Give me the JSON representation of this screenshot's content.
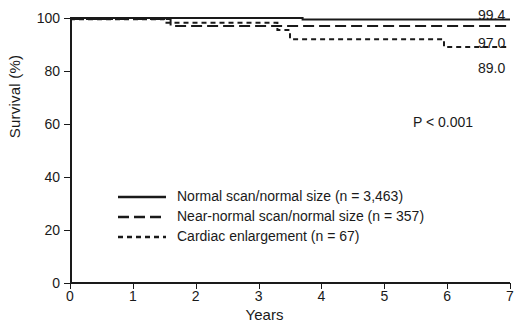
{
  "chart_data": {
    "type": "line",
    "title": "",
    "xlabel": "Years",
    "ylabel": "Survival (%)",
    "xlim": [
      0,
      7
    ],
    "ylim": [
      0,
      100
    ],
    "xticks": [
      "0",
      "1",
      "2",
      "3",
      "4",
      "5",
      "6",
      "7"
    ],
    "yticks": [
      "0",
      "20",
      "40",
      "60",
      "80",
      "100"
    ],
    "grid": false,
    "legend_position": "lower-left-inside",
    "annotation": "P < 0.001",
    "series": [
      {
        "name": "Normal scan/normal size (n = 3,463)",
        "style": "solid",
        "n": "3,463",
        "endpoint_label": "99.4",
        "x": [
          0,
          3.7,
          3.7,
          7
        ],
        "y": [
          100,
          100,
          99.4,
          99.4
        ]
      },
      {
        "name": "Near-normal scan/normal size (n = 357)",
        "style": "long-dash",
        "n": "357",
        "endpoint_label": "97.0",
        "x": [
          0,
          1.6,
          1.6,
          7
        ],
        "y": [
          99.6,
          99.6,
          97.0,
          97.0
        ]
      },
      {
        "name": "Cardiac enlargement (n = 67)",
        "style": "short-dash",
        "n": "67",
        "endpoint_label": "89.0",
        "x": [
          0,
          1.5,
          1.5,
          3.3,
          3.3,
          3.5,
          3.5,
          5.95,
          5.95,
          7
        ],
        "y": [
          99.5,
          99.5,
          98.2,
          98.2,
          95.5,
          95.5,
          92.0,
          92.0,
          89.0,
          89.0
        ]
      }
    ]
  },
  "legend": {
    "items": [
      {
        "label": "Normal scan/normal size (n = 3,463)",
        "style": "solid"
      },
      {
        "label": "Near-normal scan/normal size (n = 357)",
        "style": "long-dash"
      },
      {
        "label": "Cardiac enlargement (n = 67)",
        "style": "short-dash"
      }
    ]
  },
  "endpoint_labels": {
    "top": "99.4",
    "middle": "97.0",
    "bottom": "89.0"
  },
  "annotation": {
    "p_value": "P < 0.001"
  },
  "axes": {
    "x_title": "Years",
    "y_title": "Survival (%)"
  },
  "colors": {
    "ink": "#1a1a1a",
    "background": "#ffffff"
  }
}
